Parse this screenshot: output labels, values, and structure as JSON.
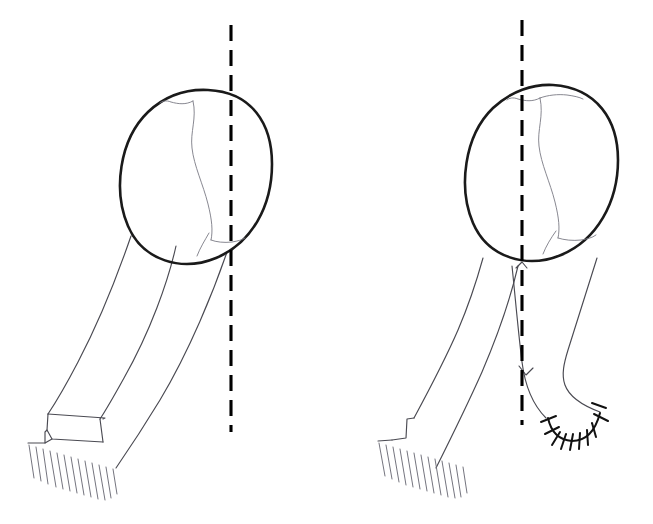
{
  "illustration": {
    "title": "Femoral rotational osteotomy: preoperative and postoperative comparison",
    "caption": "",
    "panel_count": 2,
    "background_color": "#ffffff",
    "line_color": "#1a1a1a",
    "secondary_line_color": "#4a4a52",
    "axis_color": "#000000",
    "canvas": {
      "width": 653,
      "height": 524
    }
  },
  "panels": [
    {
      "id": "panel-left",
      "label": "",
      "role": "preoperative",
      "parts": {
        "head_outline": {
          "name": "femoral-head-outline",
          "center_x": 196,
          "center_y": 177,
          "radius_x": 75,
          "radius_y": 88,
          "stroke_width": 2.6
        },
        "internal_markings": {
          "name": "intra-capital-fissure",
          "count": 3,
          "style": "faint-curved"
        },
        "shaft": {
          "name": "femoral-shaft",
          "direction": "down-left",
          "has_overlap_segment": true
        },
        "distal_end": {
          "name": "distal-cut-surface",
          "hatch_count": 13,
          "hatch_direction": "down-right"
        },
        "axis": {
          "name": "mechanical-axis",
          "x": 231,
          "y_top": 25,
          "y_bottom": 432,
          "dash_pattern": "16 9"
        }
      },
      "suture": {
        "present": false,
        "stitch_count": 0
      }
    },
    {
      "id": "panel-right",
      "label": "",
      "role": "postoperative",
      "parts": {
        "head_outline": {
          "name": "femoral-head-outline",
          "center_x": 541,
          "center_y": 173,
          "radius_x": 77,
          "radius_y": 89,
          "stroke_width": 2.6
        },
        "internal_markings": {
          "name": "intra-capital-fissure",
          "count": 3,
          "style": "faint-curved"
        },
        "shaft": {
          "name": "femoral-shaft",
          "direction": "down-left",
          "has_crossing_fragment": true,
          "crossing_point_x": 526,
          "crossing_point_y": 375
        },
        "distal_end": {
          "name": "distal-cut-surface",
          "hatch_count": 13,
          "hatch_direction": "down-right"
        },
        "axis": {
          "name": "mechanical-axis",
          "x": 522,
          "y_top": 20,
          "y_bottom": 425,
          "dash_pattern": "16 9"
        }
      },
      "suture": {
        "present": true,
        "name": "suture-line",
        "stitch_count": 9,
        "shape": "u-curve",
        "start_x": 548,
        "start_y": 418,
        "end_x": 600,
        "end_y": 413
      }
    }
  ]
}
